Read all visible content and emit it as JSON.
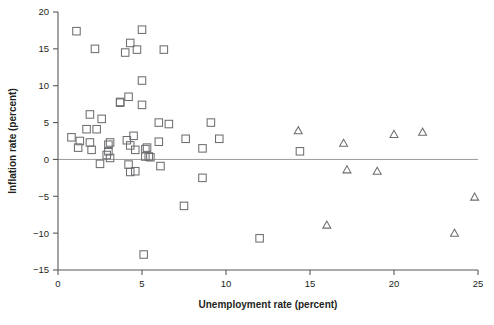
{
  "chart_data": {
    "type": "scatter",
    "title": "",
    "xlabel": "Unemployment rate (percent)",
    "ylabel": "Inflation rate (percent)",
    "xlim": [
      0,
      25
    ],
    "ylim": [
      -15,
      20
    ],
    "xticks": [
      0,
      5,
      10,
      15,
      20,
      25
    ],
    "yticks": [
      -15,
      -10,
      -5,
      0,
      5,
      10,
      15,
      20
    ],
    "xtick_labels": [
      "0",
      "5",
      "10",
      "15",
      "20",
      "25"
    ],
    "ytick_labels": [
      "−15",
      "−10",
      "−5",
      "0",
      "5",
      "10",
      "15",
      "20"
    ],
    "grid": false,
    "legend": "none",
    "reference_lines": [
      {
        "axis": "y",
        "value": 0,
        "color": "#9a9a9c"
      }
    ],
    "series": [
      {
        "name": "square-markers",
        "marker": "square",
        "color": "#6d6e71",
        "points": [
          [
            1.1,
            17.4
          ],
          [
            2.2,
            15.0
          ],
          [
            4.0,
            14.5
          ],
          [
            4.3,
            15.8
          ],
          [
            4.7,
            14.9
          ],
          [
            5.0,
            17.6
          ],
          [
            6.3,
            14.9
          ],
          [
            5.0,
            10.7
          ],
          [
            4.2,
            8.5
          ],
          [
            3.7,
            7.7
          ],
          [
            3.7,
            7.8
          ],
          [
            5.0,
            7.4
          ],
          [
            1.9,
            6.1
          ],
          [
            2.6,
            5.5
          ],
          [
            6.0,
            5.0
          ],
          [
            6.6,
            4.8
          ],
          [
            9.1,
            5.0
          ],
          [
            1.7,
            4.1
          ],
          [
            2.3,
            4.1
          ],
          [
            4.5,
            3.2
          ],
          [
            0.8,
            3.0
          ],
          [
            4.1,
            2.6
          ],
          [
            6.0,
            2.4
          ],
          [
            1.3,
            2.5
          ],
          [
            1.9,
            2.3
          ],
          [
            3.1,
            2.3
          ],
          [
            3.0,
            2.0
          ],
          [
            4.3,
            1.9
          ],
          [
            7.6,
            2.8
          ],
          [
            9.6,
            2.8
          ],
          [
            1.2,
            1.6
          ],
          [
            2.0,
            1.3
          ],
          [
            3.0,
            1.1
          ],
          [
            4.6,
            1.3
          ],
          [
            5.2,
            1.4
          ],
          [
            5.3,
            1.6
          ],
          [
            8.6,
            1.5
          ],
          [
            14.4,
            1.1
          ],
          [
            2.9,
            0.6
          ],
          [
            3.1,
            0.2
          ],
          [
            5.2,
            0.4
          ],
          [
            5.4,
            0.4
          ],
          [
            5.5,
            0.3
          ],
          [
            2.5,
            -0.6
          ],
          [
            4.2,
            -0.7
          ],
          [
            6.1,
            -0.9
          ],
          [
            4.3,
            -1.7
          ],
          [
            4.6,
            -1.6
          ],
          [
            8.6,
            -2.5
          ],
          [
            7.5,
            -6.3
          ],
          [
            12.0,
            -10.7
          ],
          [
            5.1,
            -12.9
          ]
        ]
      },
      {
        "name": "triangle-markers",
        "marker": "triangle",
        "color": "#6d6e71",
        "points": [
          [
            14.3,
            3.9
          ],
          [
            20.0,
            3.4
          ],
          [
            21.7,
            3.7
          ],
          [
            17.0,
            2.2
          ],
          [
            17.2,
            -1.4
          ],
          [
            19.0,
            -1.6
          ],
          [
            24.8,
            -5.1
          ],
          [
            16.0,
            -8.9
          ],
          [
            23.6,
            -10.0
          ]
        ]
      }
    ]
  },
  "geometry": {
    "plot_left": 58,
    "plot_right": 478,
    "plot_top": 12,
    "plot_bottom": 270,
    "marker_size": 7.5
  }
}
